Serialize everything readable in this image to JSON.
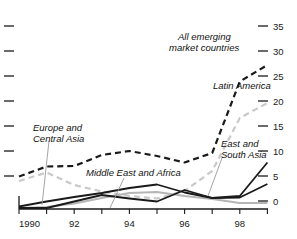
{
  "chart_data": {
    "type": "line",
    "title": "",
    "subtitle": "",
    "xlabel": "",
    "ylabel": "",
    "x": [
      1990,
      1991,
      1992,
      1993,
      1994,
      1995,
      1996,
      1997,
      1998,
      1999
    ],
    "xlim": [
      1990,
      1999.6
    ],
    "ylim": [
      0,
      36
    ],
    "yticks_right": [
      0,
      5,
      10,
      15,
      20,
      25,
      30,
      35
    ],
    "ytick_labels_right": [
      "0",
      "5",
      "10",
      "15",
      "20",
      "25",
      "30",
      "35"
    ],
    "yticks_left_unlabeled": [
      0,
      5,
      10,
      15,
      20,
      25,
      30,
      35
    ],
    "xticks": [
      1990,
      1991,
      1992,
      1993,
      1994,
      1995,
      1996,
      1997,
      1998,
      1999
    ],
    "xtick_labels": [
      "1990",
      "",
      "92",
      "",
      "94",
      "",
      "96",
      "",
      "98",
      ""
    ],
    "xtick_labels_shown": [
      "1990",
      "92",
      "94",
      "96",
      "98"
    ],
    "grid": false,
    "legend_position": "inline-annotations",
    "axis_labels_side": "right",
    "series": [
      {
        "name": "All emerging market countries",
        "style": "dashed",
        "color": "#1a1a1a",
        "width": 2.2,
        "values": [
          6.5,
          8.5,
          8.6,
          10.8,
          11.6,
          10.6,
          9.3,
          11.2,
          25.5,
          28.8
        ]
      },
      {
        "name": "Latin America",
        "style": "dashed",
        "color": "#c9c9c9",
        "width": 2.2,
        "values": [
          5.6,
          7.3,
          4.8,
          3.5,
          2.6,
          2.1,
          3.6,
          7.6,
          18.2,
          21.2
        ]
      },
      {
        "name": "Europe and Central Asia",
        "style": "solid",
        "color": "#b5b5b5",
        "width": 1.8,
        "values": [
          0.2,
          0.4,
          1.1,
          2.2,
          3.2,
          3.4,
          2.6,
          2.0,
          1.2,
          1.2
        ]
      },
      {
        "name": "Middle East and Africa",
        "style": "solid",
        "color": "#1a1a1a",
        "width": 1.8,
        "values": [
          0.5,
          1.5,
          2.4,
          3.2,
          4.2,
          4.9,
          3.3,
          2.2,
          2.3,
          5.0
        ]
      },
      {
        "name": "East and South Asia",
        "style": "solid",
        "color": "#1a1a1a",
        "width": 1.8,
        "values": [
          0.2,
          0.2,
          1.5,
          2.8,
          2.1,
          1.5,
          3.8,
          2.2,
          2.6,
          9.3
        ]
      }
    ],
    "annotations": [
      {
        "text_line1": "All emerging",
        "text_line2": "market countries"
      },
      {
        "text_line1": "Latin America",
        "text_line2": ""
      },
      {
        "text_line1": "Europe and",
        "text_line2": "Central Asia"
      },
      {
        "text_line1": "Middle East and Africa",
        "text_line2": ""
      },
      {
        "text_line1": "East and",
        "text_line2": "South Asia"
      }
    ]
  },
  "labels": {
    "all_emerging_1": "All emerging",
    "all_emerging_2": "market countries",
    "latin_america": "Latin America",
    "europe_1": "Europe and",
    "europe_2": "Central Asia",
    "middle_east": "Middle East and Africa",
    "east_asia_1": "East and",
    "east_asia_2": "South Asia"
  },
  "axis": {
    "y_right": [
      "35",
      "30",
      "25",
      "20",
      "15",
      "10",
      "5",
      "0"
    ],
    "x_labels": [
      "1990",
      "92",
      "94",
      "96",
      "98"
    ]
  },
  "colors": {
    "ink": "#1a1a1a",
    "light_series": "#c9c9c9",
    "mid_series": "#b5b5b5",
    "background": "#ffffff"
  }
}
